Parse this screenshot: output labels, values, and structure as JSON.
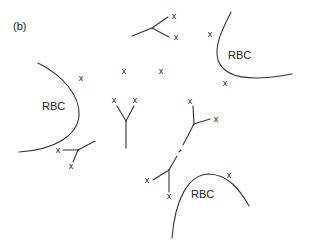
{
  "panel_label": "(b)",
  "rbc_label": "RBC",
  "marker": "x",
  "colors": {
    "line": "#333333",
    "text": "#222222",
    "background": "#ffffff"
  },
  "cells": [
    {
      "label": "RBC",
      "position": "left"
    },
    {
      "label": "RBC",
      "position": "top-right"
    },
    {
      "label": "RBC",
      "position": "bottom-center"
    }
  ],
  "markers": [
    {
      "id": "m1",
      "text": "x",
      "x": 174,
      "y": 19
    },
    {
      "id": "m2",
      "text": "x",
      "x": 176,
      "y": 40
    },
    {
      "id": "m3",
      "text": "x",
      "x": 210,
      "y": 37
    },
    {
      "id": "m4",
      "text": "x",
      "x": 225,
      "y": 86
    },
    {
      "id": "m5",
      "text": "x",
      "x": 81,
      "y": 81
    },
    {
      "id": "m6",
      "text": "x",
      "x": 124,
      "y": 74
    },
    {
      "id": "m7",
      "text": "x",
      "x": 161,
      "y": 74
    },
    {
      "id": "m8",
      "text": "x",
      "x": 114,
      "y": 103
    },
    {
      "id": "m9",
      "text": "x",
      "x": 135,
      "y": 103
    },
    {
      "id": "m10",
      "text": "x",
      "x": 190,
      "y": 104
    },
    {
      "id": "m11",
      "text": "x",
      "x": 216,
      "y": 120
    },
    {
      "id": "m12",
      "text": "x",
      "x": 57,
      "y": 152
    },
    {
      "id": "m13",
      "text": "x",
      "x": 71,
      "y": 168
    },
    {
      "id": "m14",
      "text": "x",
      "x": 147,
      "y": 182
    },
    {
      "id": "m15",
      "text": "x",
      "x": 169,
      "y": 198
    },
    {
      "id": "m16",
      "text": "x",
      "x": 229,
      "y": 178
    }
  ]
}
